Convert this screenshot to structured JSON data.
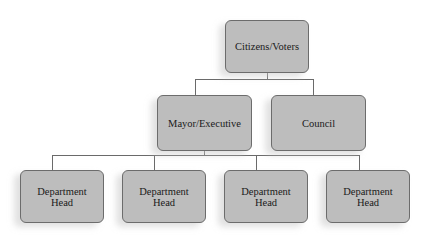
{
  "nodes": {
    "top": {
      "label": "Citizens/Voters"
    },
    "executive": {
      "label": "Mayor/Executive"
    },
    "council": {
      "label": "Council"
    },
    "departments": [
      {
        "line1": "Department",
        "line2": "Head"
      },
      {
        "line1": "Department",
        "line2": "Head"
      },
      {
        "line1": "Department",
        "line2": "Head"
      },
      {
        "line1": "Department",
        "line2": "Head"
      }
    ]
  },
  "edges": [
    {
      "from": "Citizens/Voters",
      "to": "Mayor/Executive"
    },
    {
      "from": "Citizens/Voters",
      "to": "Council"
    },
    {
      "from": "Mayor/Executive",
      "to": "Department Head 1"
    },
    {
      "from": "Mayor/Executive",
      "to": "Department Head 2"
    },
    {
      "from": "Mayor/Executive",
      "to": "Department Head 3"
    },
    {
      "from": "Mayor/Executive",
      "to": "Department Head 4"
    }
  ],
  "colors": {
    "box_fill": "#bdbdbd",
    "box_border": "#6c6c6c",
    "connector": "#6a6a6a"
  }
}
